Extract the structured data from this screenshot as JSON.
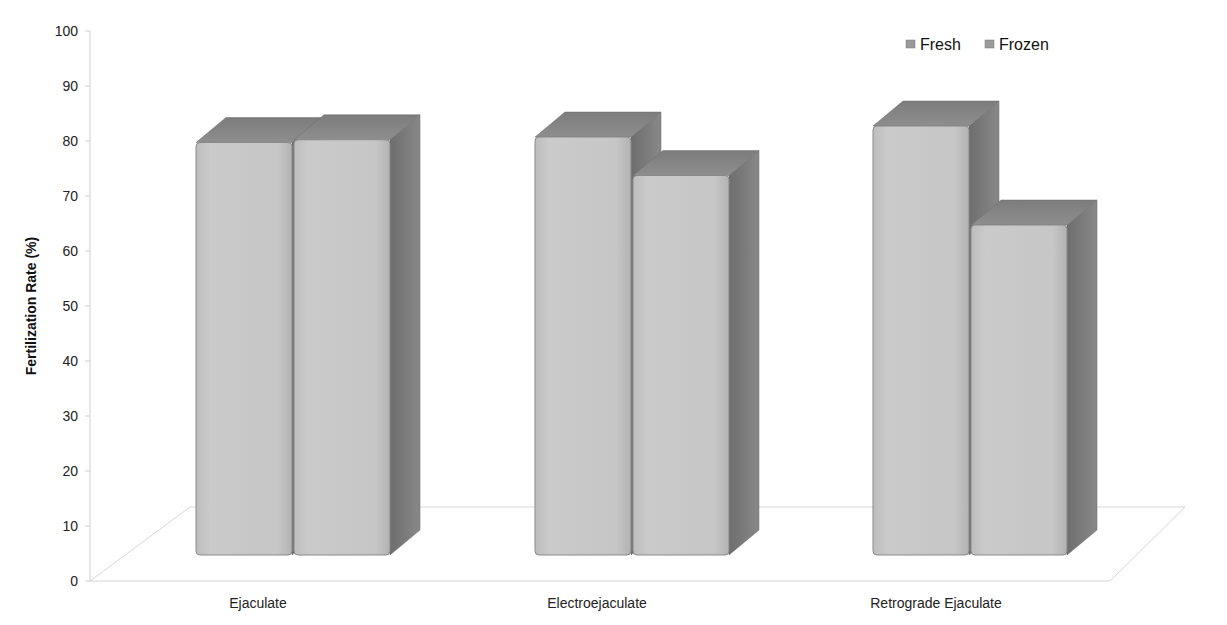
{
  "chart_data": {
    "type": "bar",
    "style": "3d-clustered-column",
    "title": "",
    "xlabel": "",
    "ylabel": "Fertilization Rate (%)",
    "ylim": [
      0,
      100
    ],
    "yticks": [
      0,
      10,
      20,
      30,
      40,
      50,
      60,
      70,
      80,
      90,
      100
    ],
    "categories": [
      "Ejaculate",
      "Electroejaculate",
      "Retrograde Ejaculate"
    ],
    "series": [
      {
        "name": "Fresh",
        "values": [
          75,
          76,
          78
        ]
      },
      {
        "name": "Frozen",
        "values": [
          75.5,
          69,
          60
        ]
      }
    ],
    "legend": {
      "position": "top-right",
      "entries": [
        "Fresh",
        "Frozen"
      ]
    },
    "grid": false
  },
  "colors": {
    "bar_front": "#c4c4c4",
    "bar_top": "#8a8a8a",
    "bar_side": "#7a7a7a",
    "axis": "#cfcfcf"
  }
}
